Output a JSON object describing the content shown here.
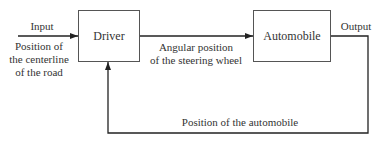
{
  "diagram": {
    "type": "feedback-control-block-diagram",
    "blocks": [
      {
        "id": "driver",
        "label": "Driver"
      },
      {
        "id": "automobile",
        "label": "Automobile"
      }
    ],
    "input": {
      "label": "Input",
      "description": [
        "Position of",
        "the centerline",
        "of the road"
      ]
    },
    "forward_signal": {
      "description": [
        "Angular position",
        "of the steering wheel"
      ]
    },
    "output": {
      "label": "Output"
    },
    "feedback": {
      "label": "Position of the automobile"
    },
    "colors": {
      "line": "#333333",
      "box_border": "#555555",
      "text": "#333333"
    }
  }
}
